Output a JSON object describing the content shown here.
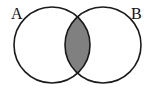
{
  "diagram": {
    "type": "venn",
    "sets": [
      {
        "label": "A",
        "cx": 52,
        "cy": 45,
        "r": 38
      },
      {
        "label": "B",
        "cx": 103,
        "cy": 45,
        "r": 38
      }
    ],
    "shaded_region": "A ∩ B",
    "colors": {
      "background": "#ffffff",
      "stroke": "#1a1a1a",
      "shade": "#808080"
    }
  }
}
